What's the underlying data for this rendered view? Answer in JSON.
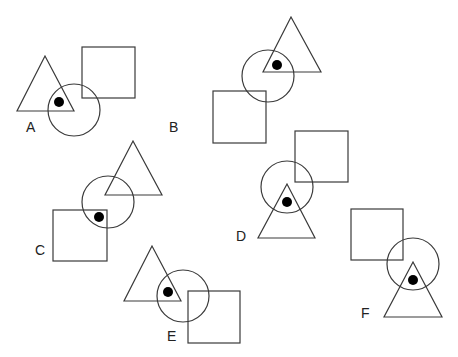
{
  "figures": [
    {
      "label": "A",
      "label_pos": [
        26,
        120
      ],
      "triangle": [
        [
          45,
          56
        ],
        [
          17,
          111
        ],
        [
          74,
          111
        ]
      ],
      "circle": {
        "cx": 74,
        "cy": 110,
        "r": 26
      },
      "square": {
        "x": 82,
        "y": 47,
        "w": 53,
        "h": 51
      },
      "dot": {
        "cx": 59,
        "cy": 102,
        "r": 5
      }
    },
    {
      "label": "B",
      "label_pos": [
        169,
        120
      ],
      "triangle": [
        [
          291,
          17
        ],
        [
          263,
          72
        ],
        [
          321,
          72
        ]
      ],
      "circle": {
        "cx": 268,
        "cy": 76,
        "r": 26
      },
      "square": {
        "x": 213,
        "y": 91,
        "w": 53,
        "h": 52
      },
      "dot": {
        "cx": 277,
        "cy": 65,
        "r": 5
      }
    },
    {
      "label": "C",
      "label_pos": [
        35,
        243
      ],
      "triangle": [
        [
          133,
          141
        ],
        [
          105,
          195
        ],
        [
          162,
          195
        ]
      ],
      "circle": {
        "cx": 108,
        "cy": 202,
        "r": 26
      },
      "square": {
        "x": 53,
        "y": 210,
        "w": 54,
        "h": 51
      },
      "dot": {
        "cx": 99,
        "cy": 217,
        "r": 5
      }
    },
    {
      "label": "D",
      "label_pos": [
        236,
        229
      ],
      "triangle": [
        [
          287,
          184
        ],
        [
          258,
          238
        ],
        [
          315,
          238
        ]
      ],
      "circle": {
        "cx": 287,
        "cy": 187,
        "r": 26
      },
      "square": {
        "x": 295,
        "y": 131,
        "w": 53,
        "h": 51
      },
      "dot": {
        "cx": 287,
        "cy": 202,
        "r": 5
      }
    },
    {
      "label": "E",
      "label_pos": [
        167,
        329
      ],
      "triangle": [
        [
          152,
          246
        ],
        [
          124,
          301
        ],
        [
          181,
          301
        ]
      ],
      "circle": {
        "cx": 183,
        "cy": 296,
        "r": 26
      },
      "square": {
        "x": 188,
        "y": 291,
        "w": 52,
        "h": 52
      },
      "dot": {
        "cx": 168,
        "cy": 292,
        "r": 5
      }
    },
    {
      "label": "F",
      "label_pos": [
        361,
        306
      ],
      "triangle": [
        [
          413,
          262
        ],
        [
          384,
          317
        ],
        [
          442,
          317
        ]
      ],
      "circle": {
        "cx": 413,
        "cy": 264,
        "r": 26
      },
      "square": {
        "x": 351,
        "y": 209,
        "w": 52,
        "h": 51
      },
      "dot": {
        "cx": 413,
        "cy": 280,
        "r": 5
      }
    }
  ],
  "colors": {
    "stroke": "#3a3a3a",
    "dot": "#000000",
    "background": "#ffffff"
  }
}
